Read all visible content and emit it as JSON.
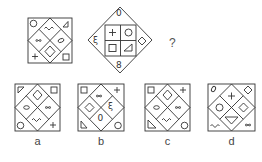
{
  "puzzle": {
    "question_mark": "?",
    "figure1": {
      "cells": {
        "top_left": "circle",
        "top_center": "wave",
        "top_right": "triangle",
        "middle_left": "infinity",
        "middle_right": "oval",
        "bottom_center": "diamond",
        "bottom_left": "plus",
        "bottom_right": "square"
      }
    },
    "figure2": {
      "cells": {
        "top": "zero",
        "left": "epsilon-wave",
        "right": "diamond",
        "bottom": "eight",
        "inner_top_left": "plus",
        "inner_top_right": "circle",
        "inner_bottom_left": "square",
        "inner_bottom_right": "triangle"
      },
      "glyphs": {
        "top": "0",
        "bottom": "8",
        "left": "ξ"
      }
    },
    "options": [
      {
        "label": "a"
      },
      {
        "label": "b"
      },
      {
        "label": "c"
      },
      {
        "label": "d"
      }
    ],
    "glyphs": {
      "b_center": "ξ",
      "b_bottom": "0"
    }
  },
  "colors": {
    "stroke": "#333333",
    "background": "#ffffff"
  }
}
